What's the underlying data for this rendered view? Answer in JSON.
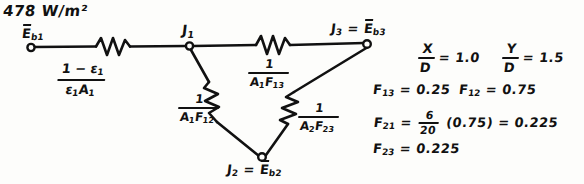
{
  "page": {
    "background_color": "#fdfdfb",
    "ink_color": "#111111"
  },
  "annotations": {
    "flux_value": "478 W/m²"
  },
  "network": {
    "nodes": [
      {
        "id": "node-eb1",
        "label": "Ēb₁",
        "x": 30,
        "y": 45
      },
      {
        "id": "node-j1",
        "label": "J₁",
        "x": 190,
        "y": 45
      },
      {
        "id": "node-j3",
        "label": "J₃ = Ēb₃",
        "x": 370,
        "y": 42
      },
      {
        "id": "node-j2",
        "label": "J₂ = Ēb₂",
        "x": 262,
        "y": 160
      }
    ],
    "resistors": [
      {
        "id": "resistor-surface-1",
        "numerator": "1 − ε₁",
        "denominator": "ε₁A₁",
        "between": [
          "Ēb₁",
          "J₁"
        ]
      },
      {
        "id": "resistor-space-13",
        "numerator": "1",
        "denominator": "A₁F₁₃",
        "between": [
          "J₁",
          "J₃"
        ]
      },
      {
        "id": "resistor-space-12",
        "numerator": "1",
        "denominator": "A₁F₁₂",
        "between": [
          "J₁",
          "J₂"
        ]
      },
      {
        "id": "resistor-space-23",
        "numerator": "1",
        "denominator": "A₂F₂₃",
        "between": [
          "J₂",
          "J₃"
        ]
      }
    ]
  },
  "calculations": {
    "ratios": [
      {
        "id": "ratio-x-d",
        "numerator": "X",
        "denominator": "D",
        "equals": "= 1.0"
      },
      {
        "id": "ratio-y-d",
        "numerator": "Y",
        "denominator": "D",
        "equals": "= 1.5"
      }
    ],
    "view_factors": [
      {
        "id": "vf-f13",
        "text": "F₁₃ = 0.25"
      },
      {
        "id": "vf-f12",
        "text": "F₁₂ = 0.75"
      },
      {
        "id": "vf-f23",
        "text": "F₂₃ = 0.225"
      }
    ],
    "reciprocity": {
      "id": "vf-f21",
      "lead": "F₂₁ =",
      "fraction_numerator": "6",
      "fraction_denominator": "20",
      "tail": "(0.75) = 0.225"
    }
  }
}
